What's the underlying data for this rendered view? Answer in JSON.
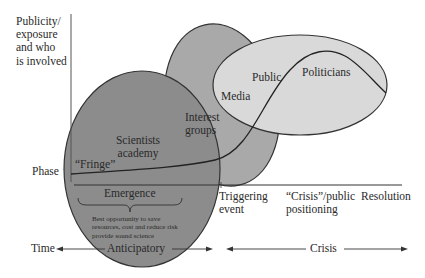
{
  "y_axis": {
    "label_lines": [
      "Publicity/",
      "exposure",
      "and who",
      "is involved"
    ]
  },
  "phase_label": "Phase",
  "actors": {
    "scientists_line1": "Scientists",
    "scientists_line2": "academy",
    "fringe": "“Fringe”",
    "interest_line1": "Interest",
    "interest_line2": "groups",
    "media": "Media",
    "public": "Public",
    "politicians": "Politicians"
  },
  "phases": {
    "emergence": "Emergence",
    "emergence_note_lines": [
      "Best opportunity to save",
      "resources, cost and reduce risk",
      "provide sound science"
    ],
    "triggering_line1": "Triggering",
    "triggering_line2": "event",
    "crisis_public_line1": "“Crisis”/public",
    "crisis_public_line2": "positioning",
    "resolution": "Resolution"
  },
  "time_axis": {
    "time": "Time",
    "anticipatory": "Anticipatory",
    "crisis": "Crisis"
  },
  "colors": {
    "scientists_fill": "#8a8a8a",
    "interest_fill": "#a8a8a8",
    "public_fill": "#d8d8d8",
    "stroke": "#333333"
  }
}
